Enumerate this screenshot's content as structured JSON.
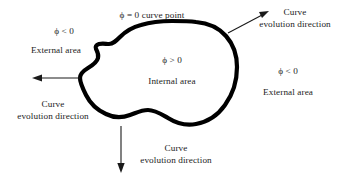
{
  "figure": {
    "title_none": "",
    "background_color": "#ffffff",
    "stroke_color": "#000000",
    "text_color": "#1c1c1c"
  },
  "curve": {
    "label": "zero-level-set-contour",
    "description": "closed irregular blob contour"
  },
  "labels": {
    "curve_point": "ϕ = 0 curve point",
    "top_left_sign": "ϕ < 0",
    "top_left_area": "External area",
    "interior_sign": "ϕ > 0",
    "interior_area": "Internal area",
    "right_sign": "ϕ < 0",
    "right_area": "External area"
  },
  "arrows": [
    {
      "name": "arrow-top-right",
      "direction": "up-right",
      "caption_line1": "Curve",
      "caption_line2": "evolution direction"
    },
    {
      "name": "arrow-left",
      "direction": "left",
      "caption_line1": "Curve",
      "caption_line2": "evolution direction"
    },
    {
      "name": "arrow-bottom",
      "direction": "down",
      "caption_line1": "Curve",
      "caption_line2": "evolution direction"
    }
  ]
}
